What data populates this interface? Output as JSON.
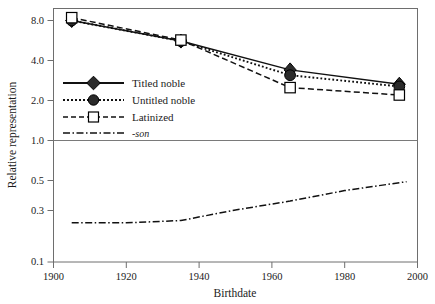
{
  "chart_data": {
    "type": "line",
    "title": "",
    "xlabel": "Birthdate",
    "ylabel": "Relative representation",
    "xlim": [
      1900,
      2000
    ],
    "ylim": [
      0.1,
      10.0
    ],
    "yscale": "log",
    "grid": false,
    "reference_line_y": 1.0,
    "legend_position": "upper-left-inside",
    "xticks": [
      "1900",
      "1920",
      "1940",
      "1960",
      "1980",
      "2000"
    ],
    "xtick_values": [
      1900,
      1920,
      1940,
      1960,
      1980,
      2000
    ],
    "yticks": [
      "8.0",
      "4.0",
      "2.0",
      "1.0",
      "0.5",
      "0.3",
      "0.1"
    ],
    "ytick_values": [
      8.0,
      4.0,
      2.0,
      1.0,
      0.5,
      0.3,
      0.1
    ],
    "x": [
      1905,
      1935,
      1965,
      1995
    ],
    "series": [
      {
        "name": "Titled noble",
        "marker": "filled-diamond",
        "linestyle": "solid",
        "values": [
          8.0,
          5.6,
          3.4,
          2.65
        ]
      },
      {
        "name": "Untitled noble",
        "marker": "filled-circle",
        "linestyle": "dotted",
        "values": [
          8.0,
          5.6,
          3.1,
          2.55
        ]
      },
      {
        "name": "Latinized",
        "marker": "open-square",
        "linestyle": "dashed",
        "values": [
          8.4,
          5.7,
          2.5,
          2.2
        ]
      },
      {
        "name": "-son",
        "marker": "none",
        "linestyle": "dash-dot",
        "x": [
          1905,
          1920,
          1935,
          1950,
          1965,
          1980,
          1997
        ],
        "values": [
          0.24,
          0.24,
          0.25,
          0.3,
          0.35,
          0.42,
          0.49
        ]
      }
    ]
  },
  "legend": {
    "entries": [
      {
        "label": "Titled noble"
      },
      {
        "label": "Untitled noble"
      },
      {
        "label": "Latinized"
      },
      {
        "label": "-son"
      }
    ]
  },
  "colors": {
    "line": "#111111",
    "frame": "#6e6e6e",
    "marker_fill": "#2b2b2b",
    "marker_open_fill": "#ffffff",
    "background": "#ffffff",
    "text": "#1b1b1b"
  }
}
